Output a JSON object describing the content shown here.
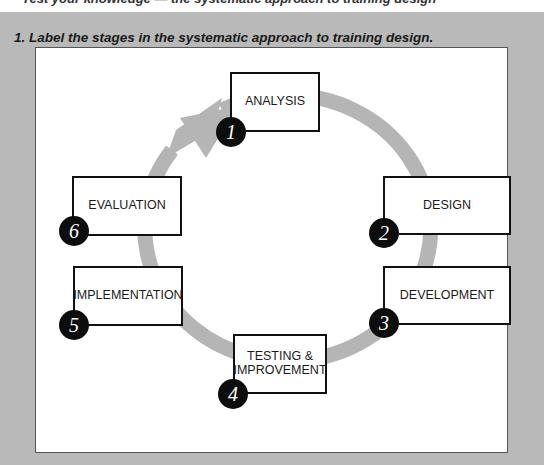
{
  "header_cutoff_text": "Test your knowledge — the systematic approach to training design",
  "question": "1.  Label the stages in the systematic approach to training design.",
  "colors": {
    "ring": "#b5b5b5",
    "background": "#b9b9b9",
    "panel": "#ffffff",
    "badge": "#0d0d0d"
  },
  "stages": [
    {
      "number": "1",
      "label": "ANALYSIS"
    },
    {
      "number": "2",
      "label": "DESIGN"
    },
    {
      "number": "3",
      "label": "DEVELOPMENT"
    },
    {
      "number": "4",
      "label": "TESTING & IMPROVEMENT"
    },
    {
      "number": "5",
      "label": "IMPLEMENTATION"
    },
    {
      "number": "6",
      "label": "EVALUATION"
    }
  ]
}
